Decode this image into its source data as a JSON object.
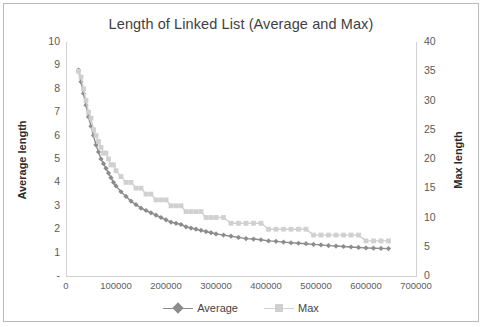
{
  "chart_data": {
    "type": "line",
    "title": "Length of Linked List (Average and Max)",
    "xlabel": "",
    "ylabel": "Average length",
    "y2label": "Max length",
    "xlim": [
      0,
      700000
    ],
    "ylim": [
      0,
      10
    ],
    "y2lim": [
      0,
      40
    ],
    "xticks": [
      "0",
      "100000",
      "200000",
      "300000",
      "400000",
      "500000",
      "600000",
      "700000"
    ],
    "xtick_values": [
      0,
      100000,
      200000,
      300000,
      400000,
      500000,
      600000,
      700000
    ],
    "yticks": [
      "-",
      "1",
      "2",
      "3",
      "4",
      "5",
      "6",
      "7",
      "8",
      "9",
      "10"
    ],
    "ytick_values": [
      0,
      1,
      2,
      3,
      4,
      5,
      6,
      7,
      8,
      9,
      10
    ],
    "y2ticks": [
      "0",
      "5",
      "10",
      "15",
      "20",
      "25",
      "30",
      "35",
      "40"
    ],
    "y2tick_values": [
      0,
      5,
      10,
      15,
      20,
      25,
      30,
      35,
      40
    ],
    "grid": false,
    "legend_position": "bottom",
    "series": [
      {
        "name": "Average",
        "axis": "left",
        "color": "#8c8c8c",
        "marker": "diamond",
        "x": [
          25000,
          30000,
          35000,
          40000,
          45000,
          50000,
          55000,
          60000,
          65000,
          70000,
          75000,
          80000,
          85000,
          90000,
          95000,
          100000,
          110000,
          120000,
          130000,
          140000,
          150000,
          160000,
          170000,
          180000,
          190000,
          200000,
          210000,
          220000,
          230000,
          240000,
          250000,
          260000,
          270000,
          280000,
          290000,
          300000,
          315000,
          330000,
          345000,
          360000,
          375000,
          390000,
          405000,
          420000,
          435000,
          450000,
          465000,
          480000,
          495000,
          510000,
          525000,
          540000,
          555000,
          570000,
          585000,
          600000,
          615000,
          630000,
          645000
        ],
        "y": [
          8.8,
          8.3,
          7.8,
          7.3,
          6.8,
          6.4,
          6.0,
          5.6,
          5.3,
          5.0,
          4.8,
          4.6,
          4.4,
          4.2,
          4.0,
          3.85,
          3.6,
          3.4,
          3.2,
          3.05,
          2.9,
          2.8,
          2.7,
          2.6,
          2.5,
          2.4,
          2.3,
          2.25,
          2.2,
          2.1,
          2.05,
          2.0,
          1.95,
          1.9,
          1.85,
          1.8,
          1.75,
          1.7,
          1.65,
          1.6,
          1.58,
          1.55,
          1.5,
          1.48,
          1.45,
          1.42,
          1.4,
          1.38,
          1.35,
          1.33,
          1.3,
          1.28,
          1.26,
          1.24,
          1.22,
          1.2,
          1.19,
          1.18,
          1.17
        ]
      },
      {
        "name": "Max",
        "axis": "right",
        "color": "#d0d0d0",
        "marker": "square",
        "x": [
          25000,
          30000,
          35000,
          40000,
          45000,
          50000,
          55000,
          60000,
          65000,
          70000,
          75000,
          80000,
          85000,
          90000,
          95000,
          100000,
          110000,
          120000,
          130000,
          140000,
          150000,
          160000,
          170000,
          180000,
          190000,
          200000,
          210000,
          220000,
          230000,
          240000,
          250000,
          260000,
          270000,
          280000,
          290000,
          300000,
          315000,
          330000,
          345000,
          360000,
          375000,
          390000,
          405000,
          420000,
          435000,
          450000,
          465000,
          480000,
          495000,
          510000,
          525000,
          540000,
          555000,
          570000,
          585000,
          600000,
          615000,
          630000,
          645000
        ],
        "y": [
          35,
          34,
          32,
          30,
          28,
          27,
          25,
          24,
          23,
          22,
          21,
          21,
          20,
          19,
          19,
          18,
          17,
          16,
          16,
          15,
          15,
          14,
          14,
          13,
          13,
          13,
          12,
          12,
          12,
          11,
          11,
          11,
          11,
          10,
          10,
          10,
          10,
          9,
          9,
          9,
          9,
          9,
          8,
          8,
          8,
          8,
          8,
          8,
          7,
          7,
          7,
          7,
          7,
          7,
          7,
          6,
          6,
          6,
          6
        ]
      }
    ]
  },
  "legend": {
    "items": [
      {
        "label": "Average"
      },
      {
        "label": "Max"
      }
    ]
  }
}
